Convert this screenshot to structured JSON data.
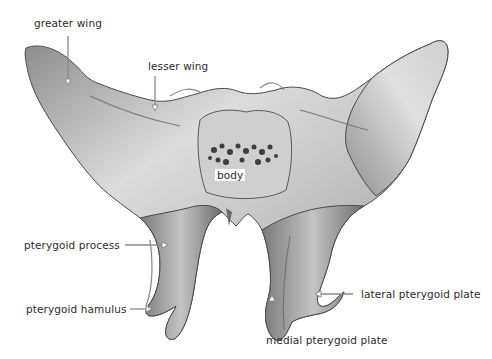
{
  "figure": {
    "background": "#ffffff",
    "bone_colors": {
      "light": "#d9d9d9",
      "mid": "#a6a6a6",
      "dark": "#5e5e5e",
      "outline": "#4a4a4a"
    },
    "arrow_color": "#8a8a8a",
    "label_color": "#2b2b2b"
  },
  "labels": {
    "greater_wing": "greater wing",
    "lesser_wing": "lesser wing",
    "body": "body",
    "pterygoid_process": "pterygoid process",
    "pterygoid_hamulus": "pterygoid hamulus",
    "lateral_pterygoid_plate": "lateral pterygoid plate",
    "medial_pterygoid_plate": "medial pterygoid plate"
  }
}
